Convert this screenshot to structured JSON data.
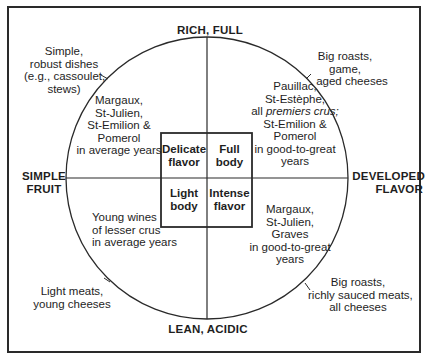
{
  "diagram": {
    "axes": {
      "top": "RICH, FULL",
      "bottom": "LEAN, ACIDIC",
      "left_line1": "SIMPLE",
      "left_line2": "FRUIT",
      "right_line1": "DEVELOPED",
      "right_line2": "FLAVOR"
    },
    "center_boxes": {
      "top_left": [
        "Delicate",
        "flavor"
      ],
      "top_right": [
        "Full",
        "body"
      ],
      "bottom_left": [
        "Light",
        "body"
      ],
      "bottom_right": [
        "Intense",
        "flavor"
      ]
    },
    "wines": {
      "top_left": [
        "Margaux,",
        "St-Julien,",
        "St-Emilion &",
        "Pomerol",
        "in average years"
      ],
      "top_right": [
        "Pauillac,",
        "St-Estèphe,",
        "all ",
        "premiers crus;",
        "St-Emilion &",
        "Pomerol",
        "in good-to-great",
        "years"
      ],
      "bottom_left": [
        "Young wines",
        "of lesser crus",
        "in average years"
      ],
      "bottom_right": [
        "Margaux,",
        "St-Julien,",
        "Graves",
        "in good-to-great",
        "years"
      ]
    },
    "food_pairings": {
      "top_left": [
        "Simple,",
        "robust dishes",
        "(e.g., cassoulet,",
        "stews)"
      ],
      "top_right": [
        "Big roasts,",
        "game,",
        "aged cheeses"
      ],
      "bottom_left": [
        "Light meats,",
        "young cheeses"
      ],
      "bottom_right": [
        "Big roasts,",
        "richly sauced meats,",
        "all cheeses"
      ]
    },
    "colors": {
      "line": "#2a2a2a",
      "text": "#1e1e1e",
      "background": "#ffffff"
    }
  }
}
